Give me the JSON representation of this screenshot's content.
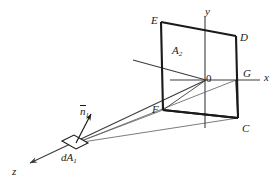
{
  "figure": {
    "domain": "diagram",
    "canvas": {
      "width": 278,
      "height": 187
    },
    "colors": {
      "background": "#ffffff",
      "outline": "#1a1a1a",
      "axis": "#3c3c3c",
      "ray": "#5a5a5a",
      "label": "#1a1a1a"
    }
  },
  "axes": [
    {
      "id": "x",
      "label": "x",
      "direction": "right",
      "label_x": 264,
      "label_y": 72
    },
    {
      "id": "y",
      "label": "y",
      "direction": "up",
      "label_x": 205,
      "label_y": 6
    },
    {
      "id": "z",
      "label": "z",
      "direction": "lower-left",
      "label_x": 12,
      "label_y": 166
    }
  ],
  "origin": {
    "label": "0",
    "x": 206,
    "y": 73
  },
  "surface": {
    "label": "A",
    "label_sub": "2",
    "label_x": 172,
    "label_y": 45,
    "vertices": [
      {
        "id": "E",
        "label": "E",
        "label_x": 151,
        "label_y": 15
      },
      {
        "id": "D",
        "label": "D",
        "label_x": 240,
        "label_y": 32
      },
      {
        "id": "C",
        "label": "C",
        "label_x": 242,
        "label_y": 123
      },
      {
        "id": "F",
        "label": "F",
        "label_x": 152,
        "label_y": 104
      },
      {
        "id": "G",
        "label": "G",
        "label_x": 243,
        "label_y": 68
      }
    ]
  },
  "element": {
    "label": "dA",
    "label_sub": "1",
    "label_x": 61,
    "label_y": 152,
    "normal": {
      "label": "n",
      "label_sub": "1",
      "overbar": true,
      "label_x": 80,
      "label_y": 106
    }
  }
}
